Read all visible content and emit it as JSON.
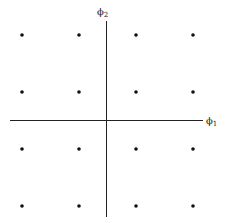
{
  "diagram": {
    "type": "16-QAM signal constellation",
    "colors": {
      "axis": "#222222",
      "point": "#111111",
      "background": "#ffffff"
    },
    "axes": {
      "horizontal": {
        "label": "ϕ1",
        "symbol": "ϕ",
        "subscript": "1"
      },
      "vertical": {
        "label": "ϕ2",
        "symbol": "ϕ",
        "subscript": "2"
      }
    },
    "grid": {
      "rows": 4,
      "cols": 4
    },
    "points": [
      {
        "i": -3,
        "q": 3
      },
      {
        "i": -1,
        "q": 3
      },
      {
        "i": 1,
        "q": 3
      },
      {
        "i": 3,
        "q": 3
      },
      {
        "i": -3,
        "q": 1
      },
      {
        "i": -1,
        "q": 1
      },
      {
        "i": 1,
        "q": 1
      },
      {
        "i": 3,
        "q": 1
      },
      {
        "i": -3,
        "q": -1
      },
      {
        "i": -1,
        "q": -1
      },
      {
        "i": 1,
        "q": -1
      },
      {
        "i": 3,
        "q": -1
      },
      {
        "i": -3,
        "q": -3
      },
      {
        "i": -1,
        "q": -3
      },
      {
        "i": 1,
        "q": -3
      },
      {
        "i": 3,
        "q": -3
      }
    ]
  }
}
